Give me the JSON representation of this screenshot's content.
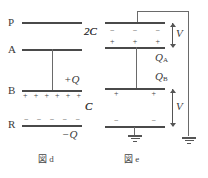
{
  "figure": {
    "title": "",
    "left": {
      "caption": "図 d",
      "plates": [
        {
          "name": "P",
          "label": "P"
        },
        {
          "name": "A",
          "label": "A"
        },
        {
          "name": "B",
          "label": "B"
        },
        {
          "name": "R",
          "label": "R"
        }
      ],
      "capacitor_labels": [
        {
          "name": "2C",
          "label": "2C"
        },
        {
          "name": "C",
          "label": "C"
        }
      ],
      "charge_labels": [
        {
          "name": "plus-Q",
          "label": "+Q"
        },
        {
          "name": "minus-Q",
          "label": "−Q"
        }
      ],
      "b_plate_signs": [
        "+",
        "+",
        "+",
        "+",
        "+",
        "+"
      ],
      "r_plate_signs": [
        "−",
        "−",
        "−",
        "−",
        "−"
      ]
    },
    "right": {
      "caption": "図 e",
      "capacitor_labels": [
        {
          "name": "2C",
          "label": "2C"
        },
        {
          "name": "C",
          "label": "C"
        }
      ],
      "charge_labels": [
        {
          "name": "QA",
          "label": "Q",
          "sub": "A"
        },
        {
          "name": "QB",
          "label": "Q",
          "sub": "B"
        }
      ],
      "voltage_labels": [
        {
          "name": "V-top",
          "label": "V"
        },
        {
          "name": "V-bottom",
          "label": "V"
        }
      ],
      "top_plate_signs": [
        "−",
        "−",
        "−"
      ],
      "upper_mid_plate_signs": [
        "+",
        "+",
        "+"
      ],
      "lower_mid_plate_signs": [
        "+",
        "+"
      ],
      "bottom_plate_signs": [
        "−",
        "−"
      ]
    }
  },
  "colors": {
    "background": "#ffffff",
    "line": "#4a4a4a",
    "text": "#3a3a3a"
  }
}
